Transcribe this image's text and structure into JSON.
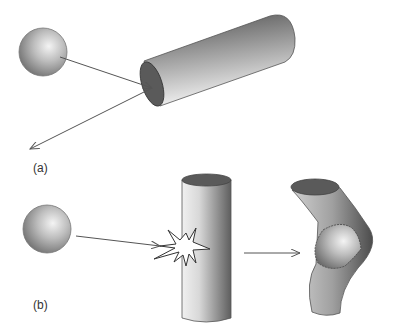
{
  "panels": [
    {
      "id": "a",
      "label": "(a)",
      "description": "Sphere strikes horizontal cylinder end and bounces off"
    },
    {
      "id": "b",
      "label": "(b)",
      "description": "Sphere collides with vertical cylinder, cylinder deforms around sphere"
    }
  ],
  "colors": {
    "stroke": "#444444",
    "arrow": "#555555",
    "shade_dark": "#5a5a5a",
    "shade_light": "#eeeeee"
  }
}
